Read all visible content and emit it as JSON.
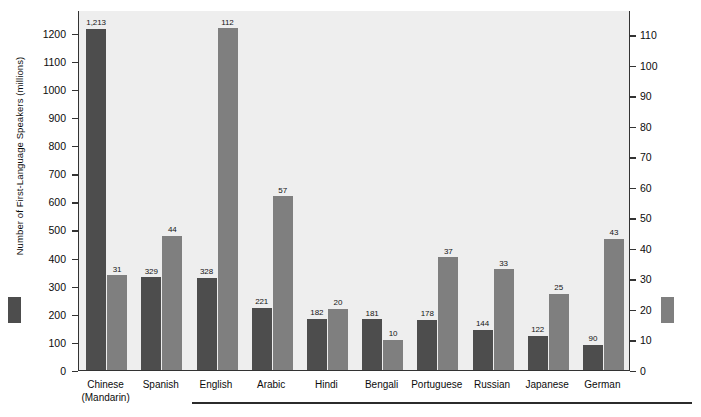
{
  "chart_data": {
    "type": "bar",
    "title": "",
    "subtitle": "",
    "xlabel": "",
    "categories": [
      "Chinese\n(Mandarin)",
      "Spanish",
      "English",
      "Arabic",
      "Hindi",
      "Bengali",
      "Portuguese",
      "Russian",
      "Japanese",
      "German"
    ],
    "series": [
      {
        "name": "Number of First-Language Speakers (millions)",
        "axis": "left",
        "color": "#4d4d4d",
        "values": [
          1213,
          329,
          328,
          221,
          182,
          181,
          178,
          144,
          122,
          90
        ],
        "value_labels": [
          "1,213",
          "329",
          "328",
          "221",
          "182",
          "181",
          "178",
          "144",
          "122",
          "90"
        ]
      },
      {
        "name": "Number of Countries Where Language Is Recognized as Either a Primary or Minority Language",
        "axis": "right",
        "color": "#7f7f7f",
        "values": [
          31,
          44,
          112,
          57,
          20,
          10,
          37,
          33,
          25,
          43
        ],
        "value_labels": [
          "31",
          "44",
          "112",
          "57",
          "20",
          "10",
          "37",
          "33",
          "25",
          "43"
        ]
      }
    ],
    "left_axis": {
      "label": "Number of First-Language Speakers (millions)",
      "ylim": [
        0,
        1280
      ],
      "ticks": [
        0,
        100,
        200,
        300,
        400,
        500,
        600,
        700,
        800,
        900,
        1000,
        1100,
        1200
      ],
      "tick_labels": [
        "0",
        "100",
        "200",
        "300",
        "400",
        "500",
        "600",
        "700",
        "800",
        "900",
        "1000",
        "1100",
        "1200"
      ]
    },
    "right_axis": {
      "label": "Number of Countries Where Language Is Recognized as Either a Primary or Minority Language",
      "ylim": [
        0,
        118
      ],
      "ticks": [
        0,
        10,
        20,
        30,
        40,
        50,
        60,
        70,
        80,
        90,
        100,
        110
      ],
      "tick_labels": [
        "0",
        "10",
        "20",
        "30",
        "40",
        "50",
        "60",
        "70",
        "80",
        "90",
        "100",
        "110"
      ]
    },
    "grid": false,
    "legend_position": "axis-titles",
    "plot_background": "#eeeeee"
  },
  "legend": {
    "left_swatch_color": "#4d4d4d",
    "right_swatch_color": "#7f7f7f"
  }
}
